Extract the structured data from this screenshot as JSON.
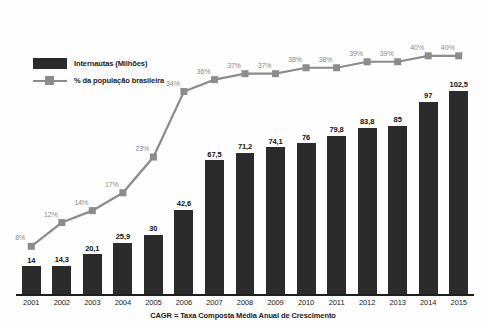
{
  "chart_data": {
    "type": "bar",
    "title": "",
    "subtitle": "",
    "xlabel": "",
    "ylabel": "",
    "grid": false,
    "legend_position": "top-left",
    "categories": [
      "2001",
      "2002",
      "2003",
      "2004",
      "2005",
      "2006",
      "2007",
      "2008",
      "2009",
      "2010",
      "2011",
      "2012",
      "2013",
      "2014",
      "2015"
    ],
    "ylim": [
      0,
      112
    ],
    "y2lim": [
      0,
      44
    ],
    "series": [
      {
        "name": "Internautas (Milhões)",
        "type": "bar",
        "color": "#2b2b2b",
        "values": [
          14,
          14.3,
          20.1,
          25.9,
          30,
          42.6,
          67.5,
          71.2,
          74.1,
          76,
          79.8,
          83.8,
          85,
          97,
          102.5
        ],
        "labels": [
          "14",
          "14,3",
          "20,1",
          "25,9",
          "30",
          "42,6",
          "67,5",
          "71,2",
          "74,1",
          "76",
          "79,8",
          "83,8",
          "85",
          "97",
          "102,5"
        ]
      },
      {
        "name": "% da população brasileira",
        "type": "line",
        "color": "#8c8c8c",
        "values": [
          8,
          12,
          14,
          17,
          23,
          34,
          36,
          37,
          37,
          38,
          38,
          39,
          39,
          40,
          40
        ],
        "labels": [
          "8%",
          "12%",
          "14%",
          "17%",
          "23%",
          "34%",
          "36%",
          "37%",
          "37%",
          "38%",
          "38%",
          "39%",
          "39%",
          "40%",
          "40%"
        ]
      }
    ]
  },
  "legend": {
    "items": [
      {
        "label": "Internautas (Milhões)",
        "marker": "bar-swatch",
        "color": "#2b2b2b"
      },
      {
        "label": "% da população brasileira",
        "marker": "line-square-swatch",
        "color": "#8c8c8c"
      }
    ]
  },
  "footnote": {
    "text": "CAGR = Taxa Composta Média Anual de Crescimento"
  },
  "colors": {
    "bar": "#2b2b2b",
    "line": "#8c8c8c",
    "axis": "#1f1f1f",
    "bar_label": "#111111",
    "pct_label": "#8a8a8a",
    "background": "#fefefe"
  }
}
